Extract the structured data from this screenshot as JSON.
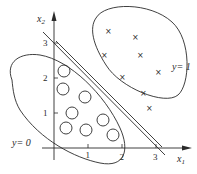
{
  "diagram": {
    "title": "",
    "axes": {
      "x_label": "x",
      "x_label_sub": "1",
      "y_label": "x",
      "y_label_sub": "2",
      "x_ticks": [
        "1",
        "2",
        "3"
      ],
      "y_ticks": [
        "1",
        "2",
        "3"
      ]
    },
    "regions": [
      {
        "label": "y = 0",
        "marker": "circle"
      },
      {
        "label": "y = 1",
        "marker": "cross"
      }
    ],
    "class0_label": "y= 0",
    "class1_label": "y= 1",
    "cross_glyph": "×",
    "decision_boundary": "x1 + x2 = 3",
    "class0_points": [
      [
        0.45,
        2.35
      ],
      [
        0.45,
        1.9
      ],
      [
        1.25,
        1.7
      ],
      [
        0.75,
        1.2
      ],
      [
        0.45,
        0.6
      ],
      [
        1.2,
        0.55
      ],
      [
        1.7,
        0.8
      ],
      [
        2.0,
        0.45
      ]
    ],
    "class1_points": [
      [
        1.95,
        3.1
      ],
      [
        2.8,
        2.95
      ],
      [
        1.75,
        2.45
      ],
      [
        2.9,
        2.45
      ],
      [
        3.15,
        1.95
      ],
      [
        2.15,
        1.8
      ],
      [
        2.85,
        1.5
      ],
      [
        3.2,
        1.1
      ]
    ]
  }
}
